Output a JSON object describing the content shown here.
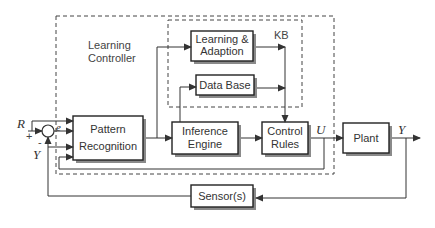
{
  "diagram": {
    "groups": {
      "learning_controller": "Learning Controller",
      "learning_controller_line1": "Learning",
      "learning_controller_line2": "Controller",
      "kb": "KB"
    },
    "blocks": {
      "learning_adaption": {
        "line1": "Learning &",
        "line2": "Adaption"
      },
      "data_base": {
        "line1": "Data Base"
      },
      "pattern_recognition": {
        "line1": "Pattern",
        "line2": "Recognition"
      },
      "inference_engine": {
        "line1": "Inference",
        "line2": "Engine"
      },
      "control_rules": {
        "line1": "Control",
        "line2": "Rules"
      },
      "plant": {
        "line1": "Plant"
      },
      "sensors": {
        "line1": "Sensor(s)"
      }
    },
    "signals": {
      "reference": "R",
      "error": "e",
      "control": "U",
      "output": "Y",
      "feedback": "Y",
      "plus": "+",
      "minus": "-"
    }
  }
}
